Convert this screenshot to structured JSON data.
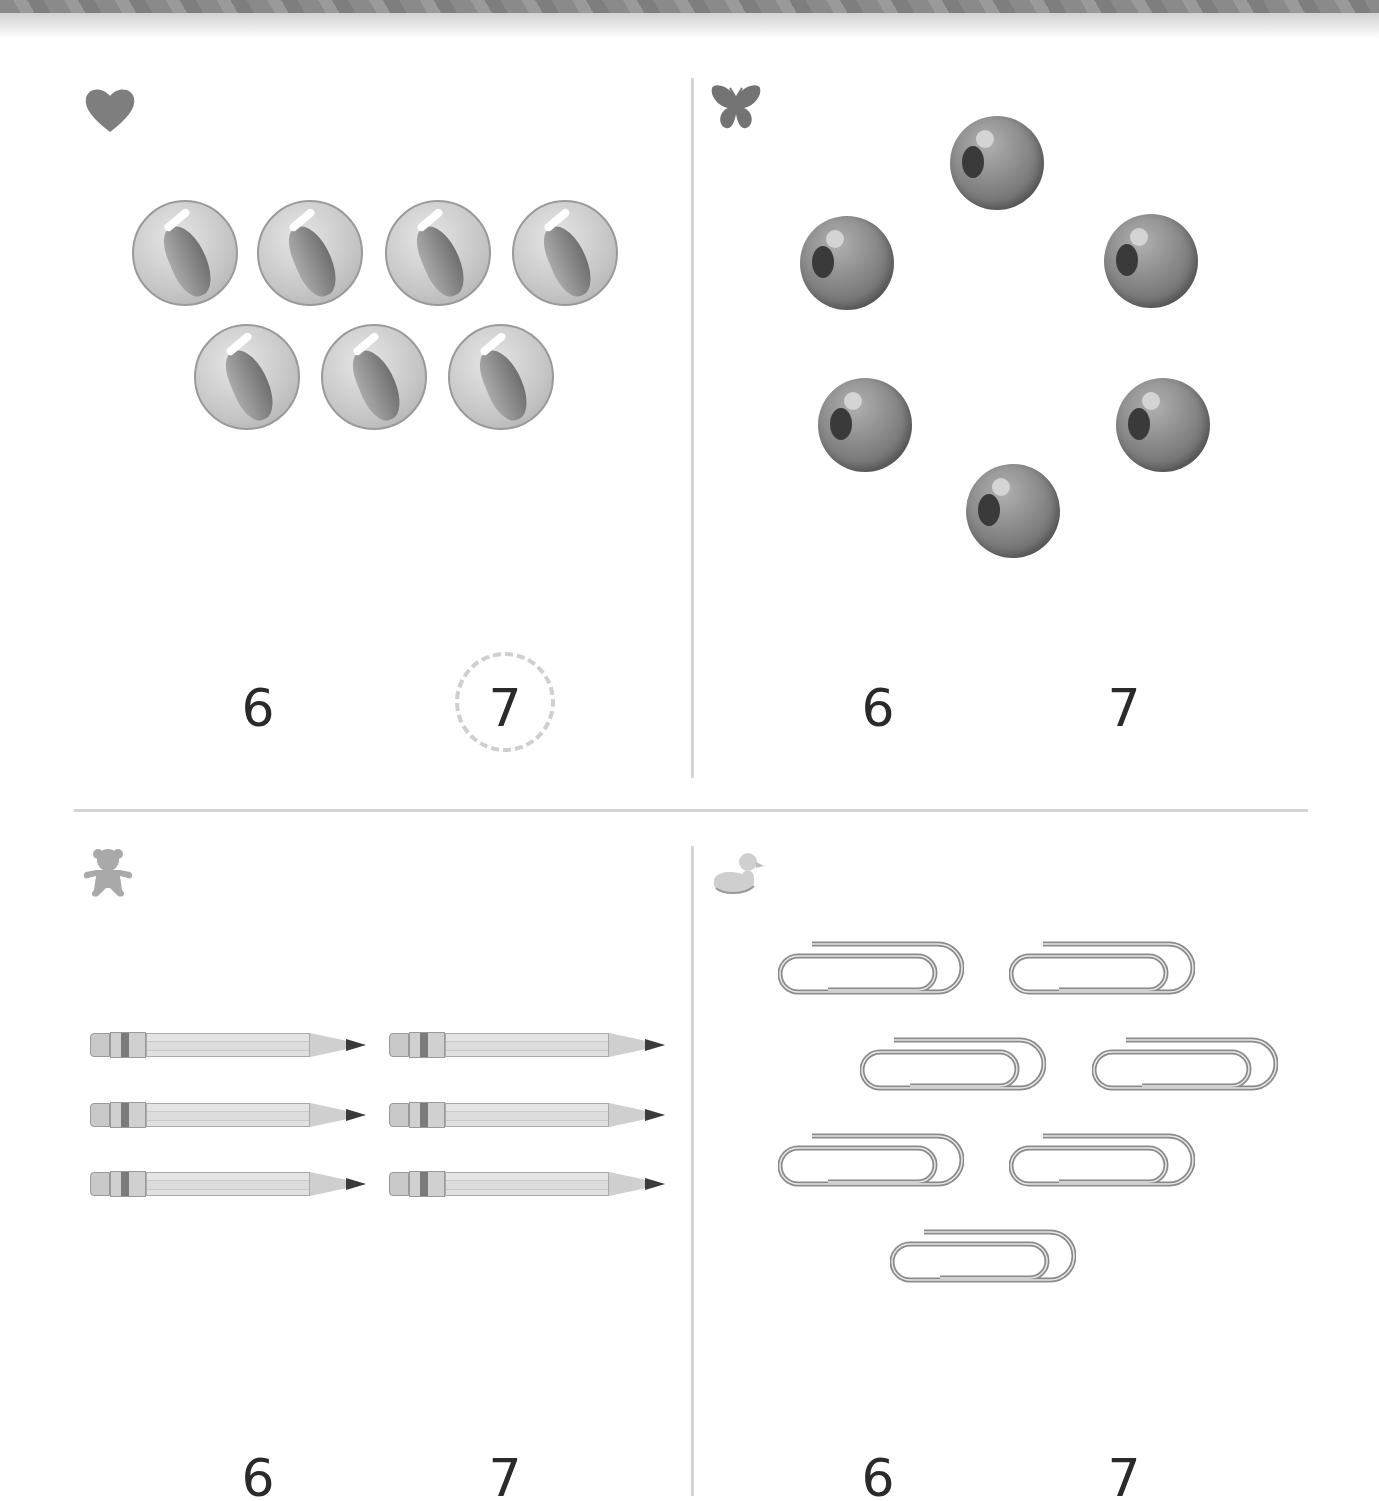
{
  "page": {
    "background": "#ffffff",
    "divider_color": "#d4d4d4",
    "number_color": "#2a2a2a"
  },
  "panels": [
    {
      "id": "heart",
      "icon": "heart-icon",
      "object": "marble",
      "object_count": 7,
      "choices": [
        "6",
        "7"
      ],
      "circled_choice": "7"
    },
    {
      "id": "butterfly",
      "icon": "butterfly-icon",
      "object": "bead",
      "object_count": 6,
      "choices": [
        "6",
        "7"
      ],
      "circled_choice": null
    },
    {
      "id": "bear",
      "icon": "teddy-bear-icon",
      "object": "pencil",
      "object_count": 6,
      "choices": [
        "6",
        "7"
      ],
      "circled_choice": null
    },
    {
      "id": "duck",
      "icon": "duck-icon",
      "object": "paper-clip",
      "object_count": 7,
      "choices": [
        "6",
        "7"
      ],
      "circled_choice": null
    }
  ]
}
